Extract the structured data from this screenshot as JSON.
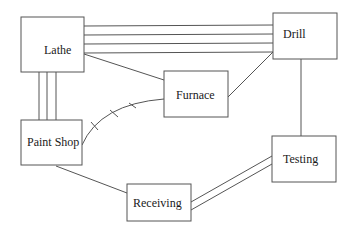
{
  "diagram": {
    "type": "facility-relationship-graph",
    "nodes": [
      {
        "id": "lathe",
        "label": "Lathe",
        "x": 21,
        "y": 17,
        "w": 63,
        "h": 55,
        "tx": 44,
        "ty": 53
      },
      {
        "id": "drill",
        "label": "Drill",
        "x": 273,
        "y": 13,
        "w": 64,
        "h": 46,
        "tx": 283,
        "ty": 38
      },
      {
        "id": "furnace",
        "label": "Furnace",
        "x": 164,
        "y": 71,
        "w": 64,
        "h": 46,
        "tx": 176,
        "ty": 99
      },
      {
        "id": "paint_shop",
        "label": "Paint Shop",
        "x": 21,
        "y": 120,
        "w": 61,
        "h": 45,
        "tx": 28,
        "ty": 146
      },
      {
        "id": "receiving",
        "label": "Receiving",
        "x": 127,
        "y": 184,
        "w": 64,
        "h": 37,
        "tx": 133,
        "ty": 207
      },
      {
        "id": "testing",
        "label": "Testing",
        "x": 272,
        "y": 136,
        "w": 64,
        "h": 46,
        "tx": 283,
        "ty": 163
      }
    ],
    "edges": [
      {
        "from": "lathe",
        "to": "drill",
        "lines": 4,
        "style": "parallel"
      },
      {
        "from": "lathe",
        "to": "paint_shop",
        "lines": 3,
        "style": "parallel"
      },
      {
        "from": "lathe",
        "to": "furnace",
        "lines": 1,
        "style": "single"
      },
      {
        "from": "furnace",
        "to": "drill",
        "lines": 1,
        "style": "single"
      },
      {
        "from": "drill",
        "to": "testing",
        "lines": 1,
        "style": "single"
      },
      {
        "from": "paint_shop",
        "to": "receiving",
        "lines": 1,
        "style": "single"
      },
      {
        "from": "receiving",
        "to": "testing",
        "lines": 2,
        "style": "parallel"
      },
      {
        "from": "paint_shop",
        "to": "furnace",
        "lines": 1,
        "style": "curved-hatched"
      }
    ]
  }
}
